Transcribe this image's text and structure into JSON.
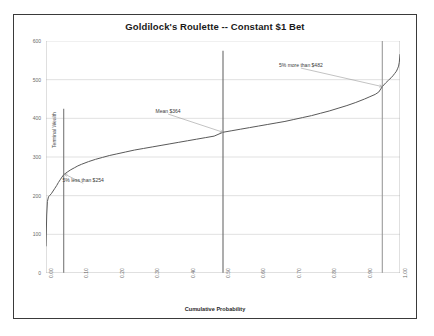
{
  "chart_data": {
    "type": "line",
    "title": "Goldilock's Roulette -- Constant $1 Bet",
    "xlabel": "Cumulative Probability",
    "ylabel": "Terminal Wealth",
    "xlim": [
      0.0,
      1.0
    ],
    "ylim": [
      0,
      600
    ],
    "grid": true,
    "legend": null,
    "xticks": [
      "0.00",
      "0.10",
      "0.20",
      "0.30",
      "0.40",
      "0.50",
      "0.60",
      "0.70",
      "0.80",
      "0.90",
      "1.00"
    ],
    "xtick_values": [
      0.0,
      0.1,
      0.2,
      0.3,
      0.4,
      0.5,
      0.6,
      0.7,
      0.8,
      0.9,
      1.0
    ],
    "yticks": [
      "0",
      "100",
      "200",
      "300",
      "400",
      "500",
      "600"
    ],
    "ytick_values": [
      0,
      100,
      200,
      300,
      400,
      500,
      600
    ],
    "series": [
      {
        "name": "Terminal Wealth CDF",
        "color": "#595959",
        "x": [
          0.0,
          0.002,
          0.004,
          0.007,
          0.01,
          0.015,
          0.02,
          0.025,
          0.03,
          0.035,
          0.04,
          0.045,
          0.05,
          0.06,
          0.07,
          0.08,
          0.09,
          0.1,
          0.12,
          0.14,
          0.16,
          0.18,
          0.2,
          0.225,
          0.25,
          0.275,
          0.3,
          0.325,
          0.35,
          0.375,
          0.4,
          0.425,
          0.45,
          0.475,
          0.5,
          0.525,
          0.55,
          0.575,
          0.6,
          0.625,
          0.65,
          0.675,
          0.7,
          0.725,
          0.75,
          0.775,
          0.8,
          0.825,
          0.85,
          0.875,
          0.9,
          0.915,
          0.93,
          0.94,
          0.95,
          0.96,
          0.968,
          0.975,
          0.98,
          0.985,
          0.99,
          0.993,
          0.996,
          0.998,
          1.0
        ],
        "y": [
          70,
          150,
          185,
          197,
          200,
          205,
          212,
          219,
          226,
          234,
          241,
          248,
          254,
          261,
          267,
          272,
          277,
          281,
          288,
          294,
          299,
          304,
          308,
          313,
          318,
          322,
          326,
          330,
          334,
          338,
          342,
          346,
          350,
          354,
          364,
          368,
          372,
          376,
          380,
          384,
          388,
          392,
          397,
          402,
          407,
          413,
          419,
          426,
          433,
          441,
          450,
          456,
          462,
          468,
          482,
          492,
          499,
          505,
          510,
          516,
          522,
          528,
          535,
          545,
          565
        ]
      }
    ],
    "vlines": [
      {
        "name": "p05-line",
        "x": 0.05,
        "y_top": 425,
        "color": "#7a7a7a"
      },
      {
        "name": "p50-line",
        "x": 0.5,
        "y_top": 575,
        "color": "#6a6a6a"
      },
      {
        "name": "p95-line",
        "x": 0.95,
        "y_top": 600,
        "color": "#9a9a9a"
      }
    ],
    "annotations": [
      {
        "name": "annotation-p95",
        "text": "5% more than $482",
        "x": 0.72,
        "y": 530,
        "target_x": 0.95,
        "target_y": 482
      },
      {
        "name": "annotation-mean",
        "text": "Mean $364",
        "x": 0.345,
        "y": 411,
        "target_x": 0.5,
        "target_y": 364
      },
      {
        "name": "annotation-p05",
        "text": "5% less than $254",
        "x": 0.105,
        "y": 232,
        "target_x": 0.052,
        "target_y": 256
      }
    ]
  }
}
